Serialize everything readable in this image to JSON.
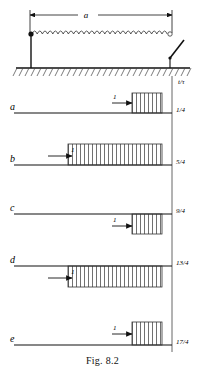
{
  "figure": {
    "caption": "Fig. 8.2",
    "dimension_label": "a",
    "time_axis_label": "t/τ",
    "pulse_amplitude_label": "1"
  },
  "circuit": {
    "source_node_icon": "filled-dot-terminal",
    "line_icon": "coil-inductor-line",
    "switch_icon": "open-switch",
    "ground_icon": "hatched-ground-plane"
  },
  "rows": [
    {
      "id": "a",
      "label": "a",
      "time_label": "1/4",
      "amplitude_label": "1",
      "polarity": "positive",
      "pulse_start_frac": 0.66,
      "pulse_end_frac": 0.93
    },
    {
      "id": "b",
      "label": "b",
      "time_label": "5/4",
      "amplitude_label": "1",
      "polarity": "positive",
      "pulse_start_frac": 0.28,
      "pulse_end_frac": 0.93
    },
    {
      "id": "c",
      "label": "c",
      "time_label": "9/4",
      "amplitude_label": "1",
      "polarity": "negative",
      "pulse_start_frac": 0.66,
      "pulse_end_frac": 0.93
    },
    {
      "id": "d",
      "label": "d",
      "time_label": "13/4",
      "amplitude_label": "1",
      "polarity": "negative",
      "pulse_start_frac": 0.28,
      "pulse_end_frac": 0.93
    },
    {
      "id": "e",
      "label": "e",
      "time_label": "17/4",
      "amplitude_label": "1",
      "polarity": "positive",
      "pulse_start_frac": 0.66,
      "pulse_end_frac": 0.93
    }
  ]
}
